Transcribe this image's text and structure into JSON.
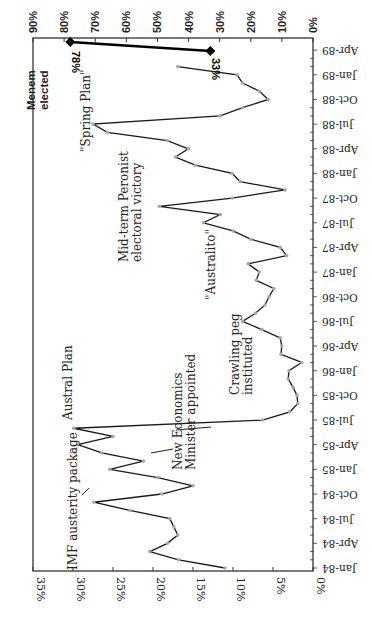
{
  "chart_data": {
    "type": "line",
    "orientation": "rotated-90-clockwise",
    "title": "",
    "xlabel": "",
    "ylabel": "",
    "ylim": [
      0,
      35
    ],
    "y_ticks": [
      "0%",
      "5%",
      "10%",
      "15%",
      "20%",
      "25%",
      "30%",
      "35%"
    ],
    "secondary_ylim": [
      0,
      90
    ],
    "secondary_y_ticks": [
      "0%",
      "10%",
      "20%",
      "30%",
      "40%",
      "50%",
      "60%",
      "70%",
      "80%",
      "90%"
    ],
    "x_tick_labels": [
      "Jan-84",
      "Apr-84",
      "Jul-84",
      "Oct-84",
      "Jan-85",
      "Apr-85",
      "Jul-85",
      "Oct-85",
      "Jan-86",
      "Apr-86",
      "Jul-86",
      "Oct-86",
      "Jan-87",
      "Apr-87",
      "Jul-87",
      "Oct-87",
      "Jan-88",
      "Apr-88",
      "Jul-88",
      "Oct-88",
      "Jan-89",
      "Apr-89"
    ],
    "grid": false,
    "series": [
      {
        "name": "Monthly inflation",
        "axis": "primary",
        "x": [
          "Jan-84",
          "Feb-84",
          "Mar-84",
          "Apr-84",
          "May-84",
          "Jun-84",
          "Jul-84",
          "Aug-84",
          "Sep-84",
          "Oct-84",
          "Nov-84",
          "Dec-84",
          "Jan-85",
          "Feb-85",
          "Mar-85",
          "Apr-85",
          "May-85",
          "Jun-85",
          "Jul-85",
          "Aug-85",
          "Sep-85",
          "Oct-85",
          "Nov-85",
          "Dec-85",
          "Jan-86",
          "Feb-86",
          "Mar-86",
          "Apr-86",
          "May-86",
          "Jun-86",
          "Jul-86",
          "Aug-86",
          "Sep-86",
          "Oct-86",
          "Nov-86",
          "Dec-86",
          "Jan-87",
          "Feb-87",
          "Mar-87",
          "Apr-87",
          "May-87",
          "Jun-87",
          "Jul-87",
          "Aug-87",
          "Sep-87",
          "Oct-87",
          "Nov-87",
          "Dec-87",
          "Jan-88",
          "Feb-88",
          "Mar-88",
          "Apr-88",
          "May-88",
          "Jun-88",
          "Jul-88",
          "Aug-88",
          "Sep-88",
          "Oct-88",
          "Nov-88",
          "Dec-88",
          "Jan-89",
          "Feb-89"
        ],
        "values": [
          11.0,
          16.8,
          20.4,
          18.2,
          16.9,
          17.4,
          17.9,
          22.9,
          27.4,
          18.9,
          15.0,
          19.4,
          25.4,
          21.2,
          26.4,
          29.4,
          25.0,
          29.9,
          6.3,
          2.9,
          1.9,
          2.0,
          2.5,
          3.1,
          3.0,
          1.4,
          4.0,
          3.9,
          4.1,
          6.4,
          8.8,
          7.2,
          6.0,
          5.5,
          4.9,
          7.1,
          6.7,
          8.1,
          3.3,
          4.1,
          7.8,
          10.0,
          13.7,
          11.6,
          19.2,
          10.1,
          3.5,
          9.1,
          10.1,
          14.7,
          17.2,
          15.6,
          18.2,
          25.7,
          27.5,
          11.6,
          8.8,
          5.6,
          6.7,
          8.8,
          9.5,
          16.9
        ]
      },
      {
        "name": "Menem elected",
        "axis": "secondary",
        "x": [
          "Mar-89",
          "Apr-89"
        ],
        "values": [
          33,
          78
        ],
        "value_labels": [
          "33%",
          "78%"
        ]
      }
    ],
    "annotations": [
      {
        "text": [
          "IMF austerity package"
        ],
        "near": "Sep-84"
      },
      {
        "text": [
          "Austral Plan"
        ],
        "near": "Jun-85"
      },
      {
        "text": [
          "New Economics",
          "Minister appointed"
        ],
        "near": "Mar-85"
      },
      {
        "text": [
          "Crawling peg",
          "instituted"
        ],
        "near": "Jul-85"
      },
      {
        "text": [
          "\"Australito\""
        ],
        "near": "Feb-87"
      },
      {
        "text": [
          "Mid-term Peronist",
          "electoral victory"
        ],
        "near": "Sep-87"
      },
      {
        "text": [
          "\"Spring Plan\""
        ],
        "near": "Jul-88"
      },
      {
        "text": [
          "Menem",
          "elected"
        ],
        "near": "Apr-89",
        "bold": true
      }
    ]
  },
  "colors": {
    "line": "#1a1a1a",
    "marker": "#a8a8a8",
    "axis": "#333333",
    "menem_line": "#000000"
  }
}
